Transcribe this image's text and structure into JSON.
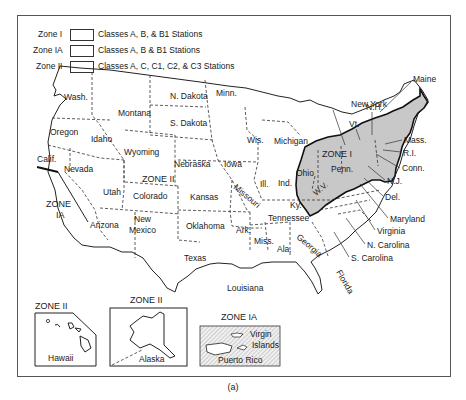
{
  "legend": {
    "items": [
      {
        "zone": "Zone I",
        "description": "Classes A, B, & B1 Stations"
      },
      {
        "zone": "Zone IA",
        "description": "Classes A, B & B1 Stations"
      },
      {
        "zone": "Zone II",
        "description": "Classes A, C, C1, C2, & C3 Stations"
      }
    ]
  },
  "zones": {
    "zone_i": "ZONE I",
    "zone_ii": "ZONE II",
    "zone_ia_line1": "ZONE",
    "zone_ia_line2": "IA"
  },
  "states": {
    "wash": "Wash.",
    "oregon": "Oregon",
    "calif": "Calif.",
    "nevada": "Nevada",
    "idaho": "Idaho",
    "montana": "Montana",
    "wyoming": "Wyoming",
    "utah": "Utah",
    "arizona": "Arizona",
    "colorado": "Colorado",
    "new_mexico_1": "New",
    "new_mexico_2": "Mexico",
    "n_dakota": "N. Dakota",
    "s_dakota": "S. Dakota",
    "nebraska": "Nebraska",
    "kansas": "Kansas",
    "oklahoma": "Oklahoma",
    "texas": "Texas",
    "minn": "Minn.",
    "iowa": "Iowa",
    "missouri": "Missouri",
    "ark": "Ark.",
    "louisiana": "Louisiana",
    "wis": "Wis.",
    "michigan": "Michigan",
    "ill": "Ill.",
    "ind": "Ind.",
    "ohio": "Ohio",
    "ky": "Ky.",
    "tennessee": "Tennessee",
    "miss": "Miss.",
    "ala": "Ala.",
    "georgia": "Georgia",
    "florida": "Florida",
    "penn": "Penn.",
    "wv": "W.V.",
    "new_york": "New York",
    "vt": "Vt.",
    "nh": "N.H.",
    "maine": "Maine",
    "mass": "Mass.",
    "ri": "R.I.",
    "conn": "Conn.",
    "nj": "N.J.",
    "del": "Del.",
    "maryland": "Maryland",
    "virginia": "Virginia",
    "n_carolina": "N. Carolina",
    "s_carolina": "S. Carolina"
  },
  "insets": {
    "hawaii": {
      "zone": "ZONE II",
      "name": "Hawaii"
    },
    "alaska": {
      "zone": "ZONE II",
      "name": "Alaska"
    },
    "puerto_rico": {
      "zone": "ZONE IA",
      "name": "Puerto Rico",
      "virgin_1": "Virgin",
      "virgin_2": "Islands"
    }
  },
  "colors": {
    "zone_i_fill": "#c8c8c8",
    "zone_ia_hatch": "#888888",
    "line": "#222222"
  },
  "caption": "(a)"
}
